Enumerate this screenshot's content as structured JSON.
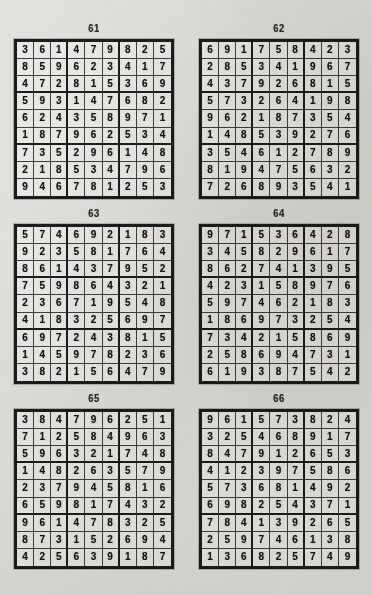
{
  "page": {
    "background_color": "#e2e1dd",
    "ink_color": "#141414",
    "grid_border_color": "#1c1c1c",
    "cell_fill_color": "#eceae6",
    "layout": "two columns by three rows of completed sudoku grids"
  },
  "puzzles": [
    {
      "number": "61",
      "position": "top-left",
      "rows": [
        [
          "3",
          "6",
          "1",
          "4",
          "7",
          "9",
          "8",
          "2",
          "5"
        ],
        [
          "8",
          "5",
          "9",
          "6",
          "2",
          "3",
          "4",
          "1",
          "7"
        ],
        [
          "4",
          "7",
          "2",
          "8",
          "1",
          "5",
          "3",
          "6",
          "9"
        ],
        [
          "5",
          "9",
          "3",
          "1",
          "4",
          "7",
          "6",
          "8",
          "2"
        ],
        [
          "6",
          "2",
          "4",
          "3",
          "5",
          "8",
          "9",
          "7",
          "1"
        ],
        [
          "1",
          "8",
          "7",
          "9",
          "6",
          "2",
          "5",
          "3",
          "4"
        ],
        [
          "7",
          "3",
          "5",
          "2",
          "9",
          "6",
          "1",
          "4",
          "8"
        ],
        [
          "2",
          "1",
          "8",
          "5",
          "3",
          "4",
          "7",
          "9",
          "6"
        ],
        [
          "9",
          "4",
          "6",
          "7",
          "8",
          "1",
          "2",
          "5",
          "3"
        ]
      ]
    },
    {
      "number": "62",
      "position": "top-right",
      "rows": [
        [
          "6",
          "9",
          "1",
          "7",
          "5",
          "8",
          "4",
          "2",
          "3"
        ],
        [
          "2",
          "8",
          "5",
          "3",
          "4",
          "1",
          "9",
          "6",
          "7"
        ],
        [
          "4",
          "3",
          "7",
          "9",
          "2",
          "6",
          "8",
          "1",
          "5"
        ],
        [
          "5",
          "7",
          "3",
          "2",
          "6",
          "4",
          "1",
          "9",
          "8"
        ],
        [
          "9",
          "6",
          "2",
          "1",
          "8",
          "7",
          "3",
          "5",
          "4"
        ],
        [
          "1",
          "4",
          "8",
          "5",
          "3",
          "9",
          "2",
          "7",
          "6"
        ],
        [
          "3",
          "5",
          "4",
          "6",
          "1",
          "2",
          "7",
          "8",
          "9"
        ],
        [
          "8",
          "1",
          "9",
          "4",
          "7",
          "5",
          "6",
          "3",
          "2"
        ],
        [
          "7",
          "2",
          "6",
          "8",
          "9",
          "3",
          "5",
          "4",
          "1"
        ]
      ]
    },
    {
      "number": "63",
      "position": "middle-left",
      "rows": [
        [
          "5",
          "7",
          "4",
          "6",
          "9",
          "2",
          "1",
          "8",
          "3"
        ],
        [
          "9",
          "2",
          "3",
          "5",
          "8",
          "1",
          "7",
          "6",
          "4"
        ],
        [
          "8",
          "6",
          "1",
          "4",
          "3",
          "7",
          "9",
          "5",
          "2"
        ],
        [
          "7",
          "5",
          "9",
          "8",
          "6",
          "4",
          "3",
          "2",
          "1"
        ],
        [
          "2",
          "3",
          "6",
          "7",
          "1",
          "9",
          "5",
          "4",
          "8"
        ],
        [
          "4",
          "1",
          "8",
          "3",
          "2",
          "5",
          "6",
          "9",
          "7"
        ],
        [
          "6",
          "9",
          "7",
          "2",
          "4",
          "3",
          "8",
          "1",
          "5"
        ],
        [
          "1",
          "4",
          "5",
          "9",
          "7",
          "8",
          "2",
          "3",
          "6"
        ],
        [
          "3",
          "8",
          "2",
          "1",
          "5",
          "6",
          "4",
          "7",
          "9"
        ]
      ]
    },
    {
      "number": "64",
      "position": "middle-right",
      "rows": [
        [
          "9",
          "7",
          "1",
          "5",
          "3",
          "6",
          "4",
          "2",
          "8"
        ],
        [
          "3",
          "4",
          "5",
          "8",
          "2",
          "9",
          "6",
          "1",
          "7"
        ],
        [
          "8",
          "6",
          "2",
          "7",
          "4",
          "1",
          "3",
          "9",
          "5"
        ],
        [
          "4",
          "2",
          "3",
          "1",
          "5",
          "8",
          "9",
          "7",
          "6"
        ],
        [
          "5",
          "9",
          "7",
          "4",
          "6",
          "2",
          "1",
          "8",
          "3"
        ],
        [
          "1",
          "8",
          "6",
          "9",
          "7",
          "3",
          "2",
          "5",
          "4"
        ],
        [
          "7",
          "3",
          "4",
          "2",
          "1",
          "5",
          "8",
          "6",
          "9"
        ],
        [
          "2",
          "5",
          "8",
          "6",
          "9",
          "4",
          "7",
          "3",
          "1"
        ],
        [
          "6",
          "1",
          "9",
          "3",
          "8",
          "7",
          "5",
          "4",
          "2"
        ]
      ]
    },
    {
      "number": "65",
      "position": "bottom-left",
      "rows": [
        [
          "3",
          "8",
          "4",
          "7",
          "9",
          "6",
          "2",
          "5",
          "1"
        ],
        [
          "7",
          "1",
          "2",
          "5",
          "8",
          "4",
          "9",
          "6",
          "3"
        ],
        [
          "5",
          "9",
          "6",
          "3",
          "2",
          "1",
          "7",
          "4",
          "8"
        ],
        [
          "1",
          "4",
          "8",
          "2",
          "6",
          "3",
          "5",
          "7",
          "9"
        ],
        [
          "2",
          "3",
          "7",
          "9",
          "4",
          "5",
          "8",
          "1",
          "6"
        ],
        [
          "6",
          "5",
          "9",
          "8",
          "1",
          "7",
          "4",
          "3",
          "2"
        ],
        [
          "9",
          "6",
          "1",
          "4",
          "7",
          "8",
          "3",
          "2",
          "5"
        ],
        [
          "8",
          "7",
          "3",
          "1",
          "5",
          "2",
          "6",
          "9",
          "4"
        ],
        [
          "4",
          "2",
          "5",
          "6",
          "3",
          "9",
          "1",
          "8",
          "7"
        ]
      ]
    },
    {
      "number": "66",
      "position": "bottom-right",
      "rows": [
        [
          "9",
          "6",
          "1",
          "5",
          "7",
          "3",
          "8",
          "2",
          "4"
        ],
        [
          "3",
          "2",
          "5",
          "4",
          "6",
          "8",
          "9",
          "1",
          "7"
        ],
        [
          "8",
          "4",
          "7",
          "9",
          "1",
          "2",
          "6",
          "5",
          "3"
        ],
        [
          "4",
          "1",
          "2",
          "3",
          "9",
          "7",
          "5",
          "8",
          "6"
        ],
        [
          "5",
          "7",
          "3",
          "6",
          "8",
          "1",
          "4",
          "9",
          "2"
        ],
        [
          "6",
          "9",
          "8",
          "2",
          "5",
          "4",
          "3",
          "7",
          "1"
        ],
        [
          "7",
          "8",
          "4",
          "1",
          "3",
          "9",
          "2",
          "6",
          "5"
        ],
        [
          "2",
          "5",
          "9",
          "7",
          "4",
          "6",
          "1",
          "3",
          "8"
        ],
        [
          "1",
          "3",
          "6",
          "8",
          "2",
          "5",
          "7",
          "4",
          "9"
        ]
      ]
    }
  ]
}
